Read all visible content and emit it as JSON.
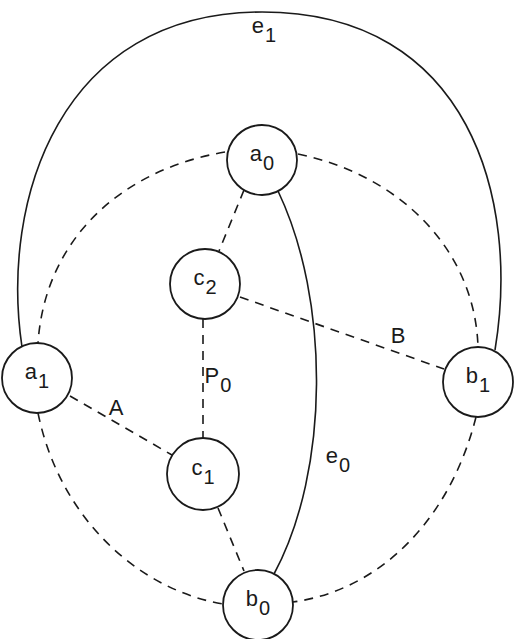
{
  "diagram": {
    "type": "graph",
    "nodes": [
      {
        "id": "a0",
        "base": "a",
        "sub": "0",
        "cx": 262,
        "cy": 160,
        "r": 35
      },
      {
        "id": "c2",
        "base": "c",
        "sub": "2",
        "cx": 205,
        "cy": 284,
        "r": 35
      },
      {
        "id": "a1",
        "base": "a",
        "sub": "1",
        "cx": 37,
        "cy": 378,
        "r": 35
      },
      {
        "id": "b1",
        "base": "b",
        "sub": "1",
        "cx": 478,
        "cy": 382,
        "r": 35
      },
      {
        "id": "c1",
        "base": "c",
        "sub": "1",
        "cx": 203,
        "cy": 474,
        "r": 36
      },
      {
        "id": "b0",
        "base": "b",
        "sub": "0",
        "cx": 258,
        "cy": 605,
        "r": 35
      }
    ],
    "edges": [
      {
        "id": "e1",
        "from": "a1",
        "to": "b1",
        "style": "solid",
        "label": "e1"
      },
      {
        "id": "e0",
        "from": "a0",
        "to": "b0",
        "style": "solid",
        "label": "e0"
      },
      {
        "from": "a0",
        "to": "a1",
        "style": "dashed"
      },
      {
        "from": "a0",
        "to": "b1",
        "style": "dashed"
      },
      {
        "from": "a1",
        "to": "b0",
        "style": "dashed"
      },
      {
        "from": "b1",
        "to": "b0",
        "style": "dashed"
      },
      {
        "from": "a0",
        "to": "c2",
        "style": "dashed"
      },
      {
        "from": "c2",
        "to": "c1",
        "style": "dashed",
        "label": "P0"
      },
      {
        "from": "c2",
        "to": "b1",
        "style": "dashed",
        "label": "B"
      },
      {
        "from": "a1",
        "to": "c1",
        "style": "dashed",
        "label": "A"
      },
      {
        "from": "c1",
        "to": "b0",
        "style": "dashed"
      }
    ],
    "edge_labels": {
      "e1": {
        "base": "e",
        "sub": "1"
      },
      "e0": {
        "base": "e",
        "sub": "0"
      },
      "P0": {
        "base": "P",
        "sub": "0"
      },
      "A": {
        "base": "A",
        "sub": ""
      },
      "B": {
        "base": "B",
        "sub": ""
      }
    },
    "colors": {
      "stroke": "#1a1a1a",
      "background": "#ffffff"
    }
  }
}
